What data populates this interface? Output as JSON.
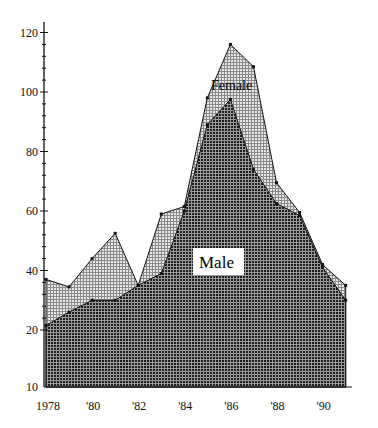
{
  "chart_data": {
    "type": "area",
    "stacked": true,
    "title": "",
    "xlabel": "",
    "ylabel": "",
    "x": [
      1978,
      1979,
      1980,
      1981,
      1982,
      1983,
      1984,
      1985,
      1986,
      1987,
      1988,
      1989,
      1990,
      1991
    ],
    "x_tick_labels": [
      "1978",
      "'80",
      "'82",
      "'84",
      "'86",
      "'88",
      "'90"
    ],
    "x_tick_years": [
      1978,
      1980,
      1982,
      1984,
      1986,
      1988,
      1990
    ],
    "y_tick_labels": [
      "10",
      "20",
      "40",
      "60",
      "80",
      "100",
      "120"
    ],
    "y_ticks": [
      20,
      40,
      60,
      80,
      100,
      120
    ],
    "ylim": [
      10,
      120
    ],
    "y_axis_note": "broken axis between 10 and 20",
    "grid": false,
    "legend": "inline labels",
    "series": [
      {
        "name": "Male",
        "values": [
          21.5,
          26,
          30,
          30,
          35,
          39,
          60,
          89,
          97.5,
          74,
          62.5,
          58.5,
          41,
          30
        ]
      },
      {
        "name": "Female",
        "values": [
          15.5,
          8.5,
          14,
          22.5,
          0,
          20,
          1.5,
          9,
          18.5,
          34.5,
          7,
          1,
          1,
          5
        ]
      }
    ],
    "total": [
      37,
      34.5,
      44,
      52.5,
      35,
      59,
      61.5,
      98,
      116,
      108.5,
      69.5,
      59.5,
      42,
      35
    ],
    "annotations": [
      {
        "text": "Male",
        "boxed": true
      },
      {
        "text": "Female",
        "boxed": false
      }
    ]
  },
  "labels": {
    "male": "Male",
    "female": "Female"
  },
  "colors": {
    "male_fill": "#2e2e2e",
    "female_fill": "#bdbdbd",
    "axis": "#111111"
  }
}
